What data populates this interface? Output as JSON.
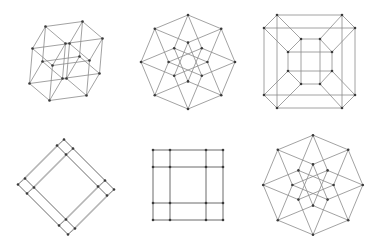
{
  "figure": {
    "colors": {
      "background": "#ffffff",
      "edge": "#8a8a8a",
      "vertex": "#3a3a3a"
    },
    "vertex_radius": 1.3,
    "panels": [
      {
        "name": "tesseract-projection-oblique",
        "center": [
          66,
          61
        ],
        "basis": [
          [
            18.5,
            -2.5
          ],
          [
            -1.5,
            17.5
          ],
          [
            10,
            8.5
          ],
          [
            -6.5,
            11
          ]
        ],
        "mode": "basis"
      },
      {
        "name": "tesseract-projection-octagonal",
        "center": [
          188,
          62
        ],
        "basis": [
          [
            16.6,
            6.9
          ],
          [
            6.9,
            16.6
          ],
          [
            -6.9,
            16.6
          ],
          [
            -16.6,
            6.9
          ]
        ],
        "mode": "basis"
      },
      {
        "name": "tesseract-projection-cube-in-cube",
        "center": [
          310,
          61
        ],
        "mode": "points",
        "points": [
          [
            264,
            28
          ],
          [
            277,
            15
          ],
          [
            264,
            95
          ],
          [
            277,
            108
          ],
          [
            355,
            28
          ],
          [
            342,
            15
          ],
          [
            355,
            95
          ],
          [
            342,
            108
          ],
          [
            288,
            52
          ],
          [
            301,
            39
          ],
          [
            288,
            71
          ],
          [
            301,
            84
          ],
          [
            332,
            52
          ],
          [
            320,
            39
          ],
          [
            332,
            71
          ],
          [
            320,
            84
          ]
        ]
      },
      {
        "name": "tesseract-projection-rotated-square",
        "center": [
          66,
          187
        ],
        "basis": [
          [
            -19.5,
            19.5
          ],
          [
            20.5,
            20.5
          ],
          [
            4.5,
            4.5
          ],
          [
            -3.5,
            3
          ]
        ],
        "mode": "basis"
      },
      {
        "name": "tesseract-projection-hexadecagon-grid",
        "center": [
          188,
          185
        ],
        "basis": [
          [
            26.5,
            0
          ],
          [
            8.5,
            0
          ],
          [
            0,
            26.5
          ],
          [
            0,
            8.5
          ]
        ],
        "mode": "basis",
        "note": "outer 16-gon vertices with inner grid lines"
      },
      {
        "name": "tesseract-projection-hexadecagon-star",
        "center": [
          313,
          185
        ],
        "basis": [
          [
            17.6,
            7.3
          ],
          [
            -7.3,
            17.6
          ],
          [
            7.3,
            17.6
          ],
          [
            -17.6,
            7.3
          ]
        ],
        "mode": "basis",
        "note": "16-gon with crossing star edges"
      }
    ]
  }
}
